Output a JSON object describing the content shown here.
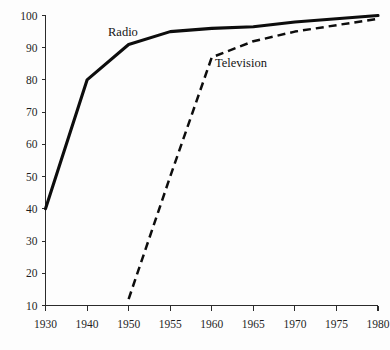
{
  "chart_data": {
    "type": "line",
    "title": "",
    "subtitle": "",
    "xlabel": "",
    "ylabel": "",
    "grid": false,
    "legend_position": "inline-annotation",
    "x": [
      "1930",
      "1940",
      "1950",
      "1955",
      "1960",
      "1965",
      "1970",
      "1975",
      "1980"
    ],
    "xtick_labels": [
      "1930",
      "1940",
      "1950",
      "1955",
      "1960",
      "1965",
      "1970",
      "1975",
      "1980"
    ],
    "x_axis_note": "categorical even spacing; 1930-1950 are decade steps, 1950-1980 are 5-year steps",
    "ytick_labels": [
      "10",
      "20",
      "30",
      "40",
      "50",
      "60",
      "70",
      "80",
      "90",
      "100"
    ],
    "ytick_values": [
      10,
      20,
      30,
      40,
      50,
      60,
      70,
      80,
      90,
      100
    ],
    "ylim": [
      10,
      100
    ],
    "series": [
      {
        "name": "Radio",
        "style": "solid",
        "color": "#0d0d0d",
        "label_text": "Radio",
        "x": [
          "1930",
          "1940",
          "1950",
          "1955",
          "1960",
          "1965",
          "1970",
          "1975",
          "1980"
        ],
        "values": [
          40,
          80,
          91,
          95,
          96,
          96.5,
          98,
          99,
          100
        ]
      },
      {
        "name": "Television",
        "style": "dashed",
        "color": "#0d0d0d",
        "label_text": "Television",
        "x": [
          "1950",
          "1955",
          "1960",
          "1965",
          "1970",
          "1975",
          "1980"
        ],
        "values": [
          12,
          50,
          87,
          92,
          95,
          97,
          99
        ]
      }
    ],
    "annotations": [
      {
        "text": "Radio",
        "series": "Radio"
      },
      {
        "text": "Television",
        "series": "Television"
      }
    ]
  },
  "labels": {
    "radio": "Radio",
    "television": "Television"
  }
}
